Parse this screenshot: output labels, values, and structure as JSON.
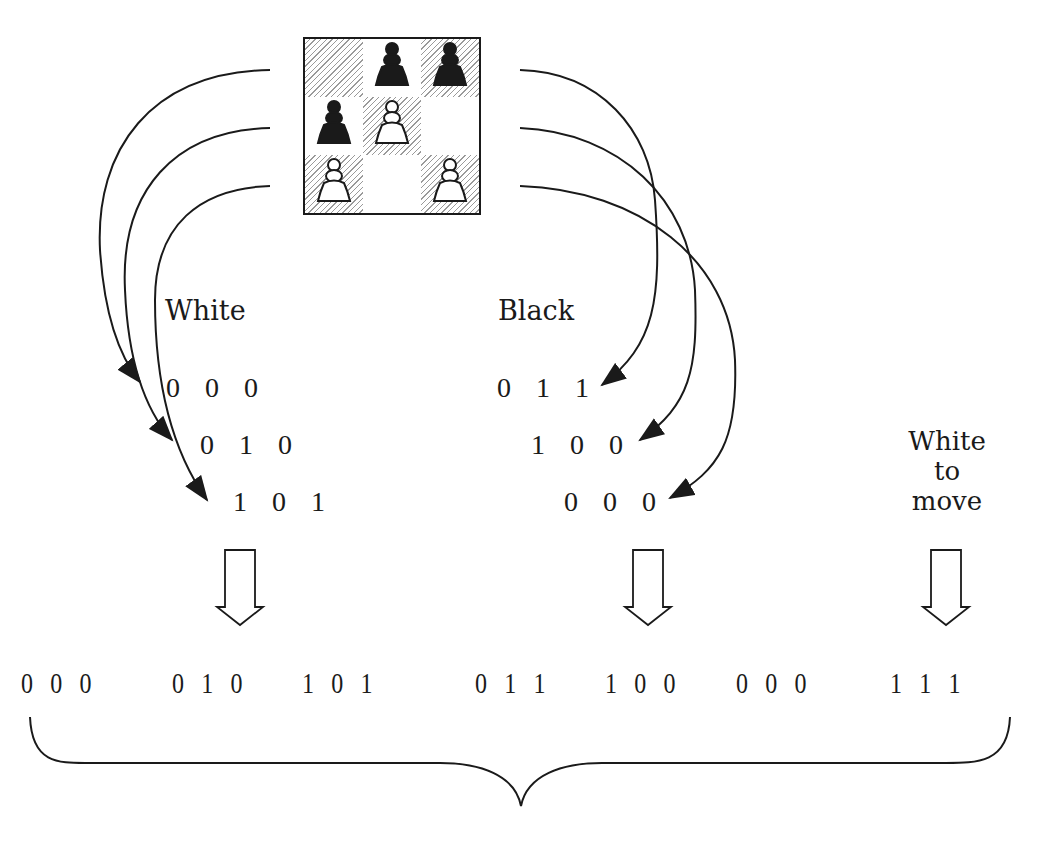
{
  "board": {
    "rows": 3,
    "cols": 3,
    "squares": [
      [
        {
          "hatched": true,
          "piece": null
        },
        {
          "hatched": false,
          "piece": "black-pawn"
        },
        {
          "hatched": true,
          "piece": "black-pawn"
        }
      ],
      [
        {
          "hatched": false,
          "piece": "black-pawn"
        },
        {
          "hatched": true,
          "piece": "white-pawn"
        },
        {
          "hatched": false,
          "piece": null
        }
      ],
      [
        {
          "hatched": true,
          "piece": "white-pawn"
        },
        {
          "hatched": false,
          "piece": null
        },
        {
          "hatched": true,
          "piece": "white-pawn"
        }
      ]
    ]
  },
  "labels": {
    "white": "White",
    "black": "Black",
    "to_move_line1": "White",
    "to_move_line2": "to move"
  },
  "white_bits": [
    "0 0 0",
    "0 1 0",
    "1 0 1"
  ],
  "black_bits": [
    "0 1 1",
    "1 0 0",
    "0 0 0"
  ],
  "bottom_bits": {
    "white": [
      "0 0 0",
      "0 1 0",
      "1 0 1"
    ],
    "black": [
      "0 1 1",
      "1 0 0",
      "0 0 0"
    ],
    "side_to_move": "1 1 1"
  },
  "colors": {
    "ink": "#1a1a1a",
    "hatch": "#9a9a9a",
    "background": "#ffffff"
  }
}
